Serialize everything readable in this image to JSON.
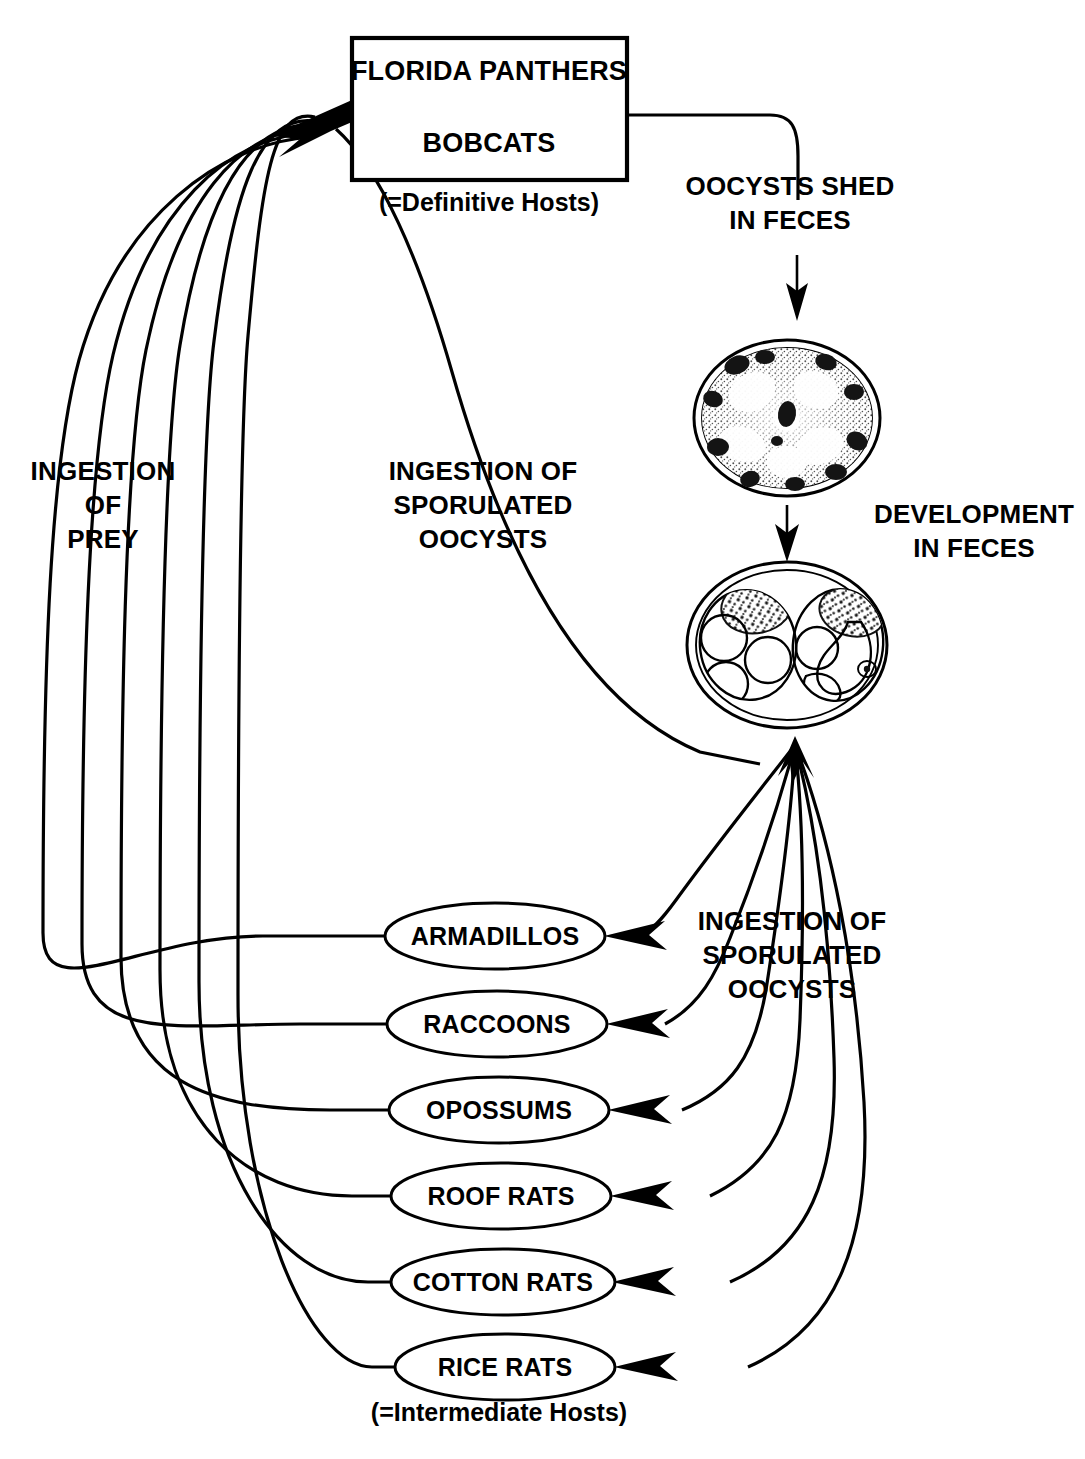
{
  "diagram": {
    "definitive_host_box": {
      "line1": "FLORIDA PANTHERS",
      "line2": "BOBCATS",
      "caption": "(=Definitive Hosts)"
    },
    "labels": {
      "oocysts_shed": "OOCYSTS SHED\nIN FECES",
      "oocysts_shed_line1": "OOCYSTS SHED",
      "oocysts_shed_line2": "IN FECES",
      "development_line1": "DEVELOPMENT",
      "development_line2": "IN FECES",
      "ingestion_prey_line1": "INGESTION",
      "ingestion_prey_line2": "OF",
      "ingestion_prey_line3": "PREY",
      "ingestion_sporulated_left_line1": "INGESTION OF",
      "ingestion_sporulated_left_line2": "SPORULATED",
      "ingestion_sporulated_left_line3": "OOCYSTS",
      "ingestion_sporulated_right_line1": "INGESTION OF",
      "ingestion_sporulated_right_line2": "SPORULATED",
      "ingestion_sporulated_right_line3": "OOCYSTS",
      "intermediate_hosts_caption": "(=Intermediate Hosts)"
    },
    "intermediate_hosts": [
      {
        "label": "ARMADILLOS"
      },
      {
        "label": "RACCOONS"
      },
      {
        "label": "OPOSSUMS"
      },
      {
        "label": "ROOF RATS"
      },
      {
        "label": "COTTON RATS"
      },
      {
        "label": "RICE RATS"
      }
    ],
    "cells": [
      {
        "name": "unsporulated-oocyst",
        "stage": "unsporulated oocyst"
      },
      {
        "name": "sporulated-oocyst",
        "stage": "sporulated oocyst with two sporocysts"
      }
    ],
    "colors": {
      "ink": "#000000",
      "paper": "#ffffff",
      "stipple": "#3a3a3a"
    }
  }
}
